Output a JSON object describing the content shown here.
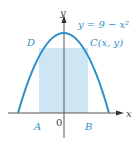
{
  "diagram": {
    "curve_equation": "y = 9 − x²",
    "labels": {
      "D": "D",
      "C": "C(x, y)",
      "A": "A",
      "B": "B",
      "origin": "0",
      "x_axis": "x",
      "y_axis": "y"
    },
    "colors": {
      "curve": "#2e8fc8",
      "rectangle_fill": "#cde6f3",
      "axes": "#555555",
      "label_blue": "#2e8fc8"
    }
  }
}
